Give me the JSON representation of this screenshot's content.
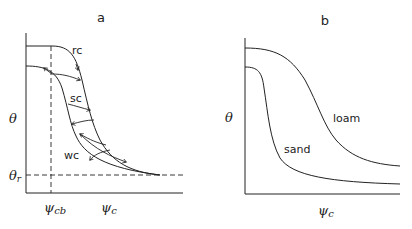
{
  "panels": [
    {
      "id": "a",
      "title": "a",
      "y_label": "θ",
      "y_tick_label": "θr",
      "x_tick_labels": [
        "ψcb",
        "ψc"
      ],
      "curve_labels": {
        "rc": "rc",
        "sc": "sc",
        "wc": "wc"
      }
    },
    {
      "id": "b",
      "title": "b",
      "y_label": "θ",
      "x_label": "ψc",
      "curve_labels": {
        "loam": "loam",
        "sand": "sand"
      }
    }
  ],
  "labels": {
    "a_title": "a",
    "a_theta": "θ",
    "a_theta_r_main": "θ",
    "a_theta_r_sub": "r",
    "a_psi_cb_main": "ψ",
    "a_psi_cb_sub": "cb",
    "a_psi_c_main": "ψ",
    "a_psi_c_sub": "c",
    "a_rc": "rc",
    "a_sc": "sc",
    "a_wc": "wc",
    "b_title": "b",
    "b_theta": "θ",
    "b_psi_c_main": "ψ",
    "b_psi_c_sub": "c",
    "b_loam": "loam",
    "b_sand": "sand"
  },
  "colors": {
    "line": "#222222",
    "background": "#ffffff"
  }
}
